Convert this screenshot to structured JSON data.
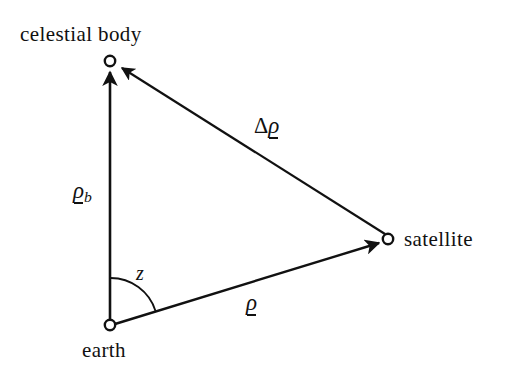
{
  "figure": {
    "type": "geometry-diagram",
    "background_color": "#ffffff",
    "stroke_color": "#111111"
  },
  "labels": {
    "celestial_body": "celestial  body",
    "earth": "earth",
    "satellite": "satellite",
    "angle_z": "z",
    "vector_rho_b_symbol": "ρ",
    "vector_rho_b_subscript": "b",
    "vector_rho_symbol": "ρ",
    "vector_delta_rho_delta": "Δ",
    "vector_delta_rho_symbol": "ρ"
  },
  "vertices": {
    "celestial_body": {
      "x": 110,
      "y": 61,
      "marker": "open-circle"
    },
    "earth": {
      "x": 110,
      "y": 325,
      "marker": "open-circle"
    },
    "satellite": {
      "x": 388,
      "y": 239,
      "marker": "open-circle"
    }
  },
  "vectors": [
    {
      "name": "rho-b",
      "from": "earth",
      "to": "celestial_body",
      "label": "ρb",
      "arrowhead": "at-celestial-body"
    },
    {
      "name": "rho",
      "from": "earth",
      "to": "satellite",
      "label": "ρ",
      "arrowhead": "at-satellite"
    },
    {
      "name": "delta-rho",
      "from": "satellite",
      "to": "celestial_body",
      "label": "Δρ",
      "arrowhead": "at-celestial-body"
    }
  ],
  "angle_arc": {
    "name": "zenith-angle-z",
    "at_vertex": "earth",
    "between": [
      "rho-b",
      "rho"
    ],
    "label": "z",
    "radius": 47
  }
}
